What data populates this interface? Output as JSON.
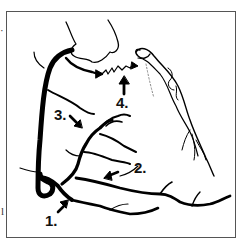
{
  "diagram": {
    "stroke_color": "#000000",
    "frame_color": "#555555",
    "background": "#ffffff",
    "labels": [
      {
        "id": "1",
        "text": "1."
      },
      {
        "id": "2",
        "text": "2."
      },
      {
        "id": "3",
        "text": "3."
      },
      {
        "id": "4",
        "text": "4."
      }
    ],
    "edge_fragments": {
      "left_char": "l",
      "top_mark": "·"
    }
  }
}
